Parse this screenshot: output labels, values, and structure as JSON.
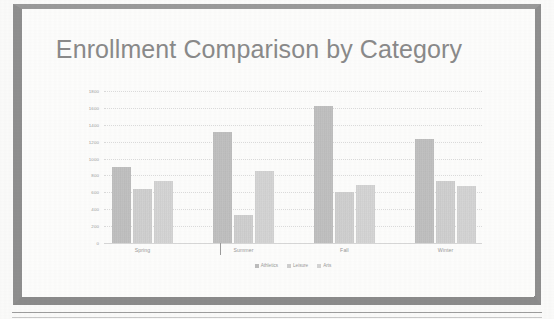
{
  "slide": {
    "title": "Enrollment Comparison by Category"
  },
  "chart_data": {
    "type": "bar",
    "title": "Enrollment Comparison by Category",
    "xlabel": "",
    "ylabel": "",
    "ylim": [
      0,
      1800
    ],
    "yticks": [
      0,
      200,
      400,
      600,
      800,
      1000,
      1200,
      1400,
      1600,
      1800
    ],
    "ytick_labels": [
      "0",
      "200",
      "400",
      "600",
      "800",
      "1000",
      "1200",
      "1400",
      "1600",
      "1800"
    ],
    "grid": true,
    "legend_position": "bottom",
    "categories": [
      "Spring",
      "Summer",
      "Fall",
      "Winter"
    ],
    "series": [
      {
        "name": "Athletics",
        "color": "#bdbdbd",
        "values": [
          900,
          1310,
          1620,
          1230
        ]
      },
      {
        "name": "Leisure",
        "color": "#cfcfcf",
        "values": [
          640,
          330,
          600,
          730
        ]
      },
      {
        "name": "Arts",
        "color": "#d4d4d4",
        "values": [
          730,
          850,
          690,
          670
        ]
      }
    ]
  },
  "legend": {
    "items": [
      {
        "label": "Athletics"
      },
      {
        "label": "Leisure"
      },
      {
        "label": "Arts"
      }
    ]
  },
  "colors": {
    "title": "#8a8a8a",
    "frame": "#8e8e8e",
    "axis": "#9c9c9c",
    "grid": "#dcdcdc"
  }
}
